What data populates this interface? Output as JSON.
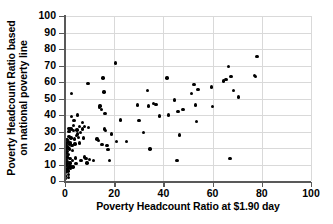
{
  "chart_data": {
    "type": "scatter",
    "title": "",
    "xlabel": "Poverty Headcount Ratio at $1.90 day",
    "ylabel_line1": "Poverty Headcount Ratio based",
    "ylabel_line2": "on national poverty line",
    "xlim": [
      0,
      100
    ],
    "ylim": [
      0,
      100
    ],
    "xticks": [
      0,
      20,
      40,
      60,
      80,
      100
    ],
    "yticks": [
      0,
      10,
      20,
      30,
      40,
      50,
      60,
      70,
      80,
      90,
      100
    ],
    "grid": "both",
    "legend": "none",
    "marker": "filled-circle",
    "marker_color": "#000000",
    "gridline_color": "#d9d9d9",
    "axis_color": "#595959",
    "background": "#ffffff",
    "points": [
      [
        0.2,
        1.5
      ],
      [
        0.3,
        3.0
      ],
      [
        0.3,
        5.5
      ],
      [
        0.4,
        7.0
      ],
      [
        0.4,
        9.5
      ],
      [
        0.5,
        11.0
      ],
      [
        0.5,
        13.0
      ],
      [
        0.5,
        15.0
      ],
      [
        0.6,
        17.0
      ],
      [
        0.6,
        19.0
      ],
      [
        0.7,
        20.5
      ],
      [
        0.7,
        22.0
      ],
      [
        0.8,
        23.5
      ],
      [
        0.8,
        25.0
      ],
      [
        0.9,
        21.0
      ],
      [
        1.0,
        18.0
      ],
      [
        1.0,
        14.5
      ],
      [
        1.1,
        12.0
      ],
      [
        1.1,
        10.0
      ],
      [
        1.2,
        8.0
      ],
      [
        1.2,
        6.0
      ],
      [
        1.3,
        4.0
      ],
      [
        1.3,
        2.0
      ],
      [
        1.4,
        16.0
      ],
      [
        1.5,
        20.0
      ],
      [
        1.5,
        24.0
      ],
      [
        1.6,
        27.0
      ],
      [
        1.7,
        30.0
      ],
      [
        1.7,
        32.0
      ],
      [
        1.8,
        22.5
      ],
      [
        1.9,
        19.5
      ],
      [
        2.0,
        13.5
      ],
      [
        2.0,
        11.0
      ],
      [
        2.1,
        9.0
      ],
      [
        2.2,
        7.5
      ],
      [
        2.3,
        23.0
      ],
      [
        2.4,
        26.0
      ],
      [
        2.5,
        31.5
      ],
      [
        2.6,
        39.0
      ],
      [
        2.7,
        53.0
      ],
      [
        2.8,
        21.5
      ],
      [
        3.0,
        18.5
      ],
      [
        3.1,
        12.5
      ],
      [
        3.2,
        8.5
      ],
      [
        3.4,
        30.5
      ],
      [
        3.5,
        33.5
      ],
      [
        3.6,
        36.5
      ],
      [
        3.8,
        25.5
      ],
      [
        4.0,
        22.5
      ],
      [
        4.2,
        14.0
      ],
      [
        4.5,
        10.5
      ],
      [
        4.6,
        27.5
      ],
      [
        4.8,
        31.0
      ],
      [
        5.0,
        40.0
      ],
      [
        5.2,
        28.5
      ],
      [
        5.5,
        26.5
      ],
      [
        5.8,
        23.0
      ],
      [
        6.0,
        33.0
      ],
      [
        6.2,
        29.5
      ],
      [
        6.5,
        12.5
      ],
      [
        7.0,
        35.5
      ],
      [
        7.2,
        31.5
      ],
      [
        7.5,
        26.0
      ],
      [
        7.8,
        14.5
      ],
      [
        8.0,
        33.0
      ],
      [
        8.5,
        13.5
      ],
      [
        9.0,
        11.0
      ],
      [
        9.3,
        59.0
      ],
      [
        9.5,
        32.5
      ],
      [
        10.0,
        13.0
      ],
      [
        11.5,
        12.5
      ],
      [
        13.0,
        25.5
      ],
      [
        13.5,
        24.5
      ],
      [
        14.0,
        44.5
      ],
      [
        14.3,
        45.5
      ],
      [
        14.8,
        43.5
      ],
      [
        15.0,
        22.0
      ],
      [
        15.5,
        62.5
      ],
      [
        15.8,
        54.0
      ],
      [
        16.0,
        31.5
      ],
      [
        16.2,
        41.0
      ],
      [
        16.5,
        30.5
      ],
      [
        17.0,
        21.5
      ],
      [
        17.5,
        19.0
      ],
      [
        18.0,
        12.5
      ],
      [
        19.0,
        28.5
      ],
      [
        20.5,
        71.5
      ],
      [
        21.0,
        24.0
      ],
      [
        22.5,
        37.0
      ],
      [
        25.0,
        24.0
      ],
      [
        29.5,
        46.0
      ],
      [
        30.0,
        36.5
      ],
      [
        32.0,
        29.5
      ],
      [
        33.5,
        55.0
      ],
      [
        34.0,
        45.5
      ],
      [
        34.5,
        19.5
      ],
      [
        36.0,
        47.0
      ],
      [
        37.0,
        46.5
      ],
      [
        38.5,
        39.5
      ],
      [
        41.5,
        62.5
      ],
      [
        42.0,
        40.0
      ],
      [
        44.5,
        49.0
      ],
      [
        45.5,
        12.5
      ],
      [
        46.0,
        42.0
      ],
      [
        46.5,
        28.0
      ],
      [
        48.0,
        43.5
      ],
      [
        51.5,
        53.0
      ],
      [
        52.5,
        58.5
      ],
      [
        53.0,
        46.0
      ],
      [
        53.5,
        36.0
      ],
      [
        54.0,
        55.5
      ],
      [
        59.5,
        57.0
      ],
      [
        60.0,
        45.0
      ],
      [
        64.5,
        60.5
      ],
      [
        65.5,
        61.5
      ],
      [
        66.5,
        69.5
      ],
      [
        67.0,
        13.5
      ],
      [
        67.5,
        63.5
      ],
      [
        68.5,
        55.0
      ],
      [
        70.5,
        51.0
      ],
      [
        77.0,
        64.0
      ],
      [
        77.5,
        63.5
      ],
      [
        78.0,
        75.5
      ]
    ]
  }
}
